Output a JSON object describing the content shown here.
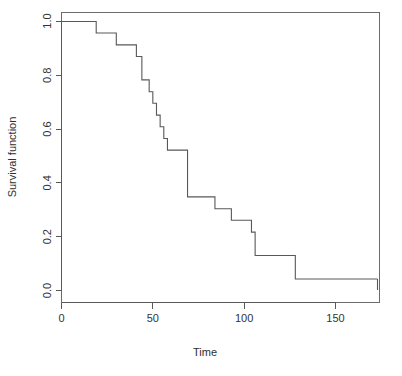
{
  "chart_data": {
    "type": "line",
    "subtype": "kaplan-meier-step",
    "title": "",
    "xlabel": "Time",
    "ylabel": "Survival function",
    "xlim": [
      0,
      178
    ],
    "ylim": [
      -0.02,
      1.04
    ],
    "grid": false,
    "legend": null,
    "xticks": [
      0,
      50,
      100,
      150
    ],
    "xtick_labels": [
      "0",
      "50",
      "100",
      "150"
    ],
    "yticks": [
      0.0,
      0.2,
      0.4,
      0.6,
      0.8,
      1.0
    ],
    "ytick_labels": [
      "0.0",
      "0.2",
      "0.4",
      "0.6",
      "0.8",
      "1.0"
    ],
    "series": [
      {
        "name": "Survival function",
        "step": "post",
        "color": "#585858",
        "x": [
          0,
          19,
          21,
          30,
          33,
          41,
          43,
          45,
          48,
          50,
          52,
          54,
          56,
          58,
          69,
          71,
          84,
          86,
          93,
          95,
          104,
          106,
          128,
          130,
          173
        ],
        "y": [
          1.0,
          1.0,
          0.957,
          0.957,
          0.913,
          0.913,
          0.87,
          0.783,
          0.739,
          0.696,
          0.652,
          0.609,
          0.565,
          0.522,
          0.522,
          0.348,
          0.348,
          0.304,
          0.304,
          0.261,
          0.217,
          0.13,
          0.13,
          0.043,
          0.043
        ],
        "points": [
          {
            "time": 0,
            "survival": 1.0
          },
          {
            "time": 19,
            "survival": 0.957
          },
          {
            "time": 30,
            "survival": 0.913
          },
          {
            "time": 41,
            "survival": 0.87
          },
          {
            "time": 44,
            "survival": 0.783
          },
          {
            "time": 48,
            "survival": 0.739
          },
          {
            "time": 50,
            "survival": 0.696
          },
          {
            "time": 52,
            "survival": 0.652
          },
          {
            "time": 54,
            "survival": 0.609
          },
          {
            "time": 56,
            "survival": 0.565
          },
          {
            "time": 58,
            "survival": 0.522
          },
          {
            "time": 69,
            "survival": 0.348
          },
          {
            "time": 84,
            "survival": 0.304
          },
          {
            "time": 93,
            "survival": 0.261
          },
          {
            "time": 104,
            "survival": 0.217
          },
          {
            "time": 106,
            "survival": 0.13
          },
          {
            "time": 128,
            "survival": 0.043
          },
          {
            "time": 173,
            "survival": 0.043
          }
        ]
      }
    ]
  },
  "axes": {
    "x_title": "Time",
    "y_title": "Survival function",
    "x_tick_labels": [
      "0",
      "50",
      "100",
      "150"
    ],
    "y_tick_labels": [
      "1.0",
      "0.8",
      "0.6",
      "0.4",
      "0.2",
      "0.0"
    ]
  },
  "colors": {
    "curve": "#585858",
    "axis": "#595959",
    "frame": "#6b6b6b",
    "background": "#ffffff",
    "text": "#333333"
  }
}
